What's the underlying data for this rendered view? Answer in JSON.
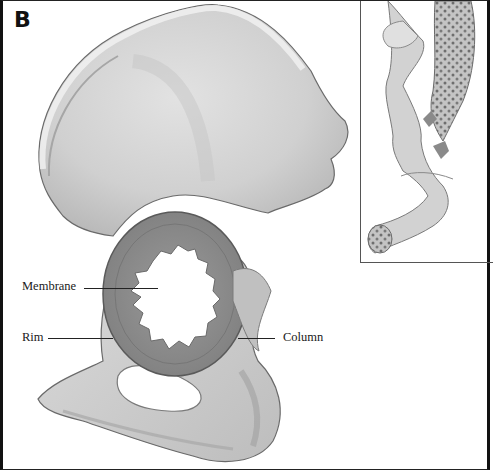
{
  "figure": {
    "panel_letter": "B",
    "labels": [
      {
        "id": "membrane",
        "text": "Membrane"
      },
      {
        "id": "rim",
        "text": "Rim"
      },
      {
        "id": "column",
        "text": "Column"
      }
    ],
    "inset": {
      "description": "cross-section view showing cancellous bone"
    }
  },
  "colors": {
    "bone_light": "#d9d9d9",
    "bone_mid": "#b8b8b8",
    "bone_dark": "#8c8c8c",
    "outline": "#6a6a6a",
    "frame": "#111111",
    "background": "#ffffff"
  }
}
